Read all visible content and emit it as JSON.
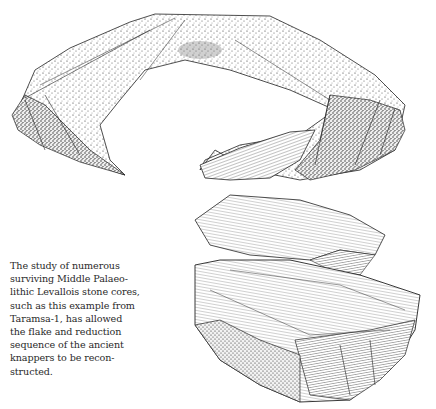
{
  "figure": {
    "top_illustration": "stone-core-arc-flake",
    "bottom_illustration": "levallois-stone-core-refit"
  },
  "caption": {
    "lines": [
      "The study of numerous",
      "surviving Middle Palaeo-",
      "lithic Levallois stone cores,",
      "such as this example from",
      "Taramsa-1,  has allowed",
      "the flake and reduction",
      "sequence of the ancient",
      "knappers to be recon-",
      "structed."
    ]
  }
}
